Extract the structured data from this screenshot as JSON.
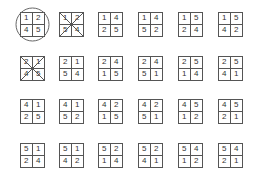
{
  "grid": {
    "columns_x": [
      20,
      59,
      98,
      138,
      178,
      218
    ],
    "rows_y": [
      12,
      56,
      99,
      143
    ],
    "permutations": [
      [
        [
          "1",
          "2",
          "4",
          "5"
        ],
        [
          "1",
          "2",
          "5",
          "4"
        ],
        [
          "1",
          "4",
          "2",
          "5"
        ],
        [
          "1",
          "4",
          "5",
          "2"
        ],
        [
          "1",
          "5",
          "2",
          "4"
        ],
        [
          "1",
          "5",
          "4",
          "2"
        ]
      ],
      [
        [
          "2",
          "1",
          "4",
          "5"
        ],
        [
          "2",
          "1",
          "5",
          "4"
        ],
        [
          "2",
          "4",
          "1",
          "5"
        ],
        [
          "2",
          "4",
          "5",
          "1"
        ],
        [
          "2",
          "5",
          "1",
          "4"
        ],
        [
          "2",
          "5",
          "4",
          "1"
        ]
      ],
      [
        [
          "4",
          "1",
          "2",
          "5"
        ],
        [
          "4",
          "1",
          "5",
          "2"
        ],
        [
          "4",
          "2",
          "1",
          "5"
        ],
        [
          "4",
          "2",
          "5",
          "1"
        ],
        [
          "4",
          "5",
          "1",
          "2"
        ],
        [
          "4",
          "5",
          "2",
          "1"
        ]
      ],
      [
        [
          "5",
          "1",
          "2",
          "4"
        ],
        [
          "5",
          "1",
          "4",
          "2"
        ],
        [
          "5",
          "2",
          "1",
          "4"
        ],
        [
          "5",
          "2",
          "4",
          "1"
        ],
        [
          "5",
          "4",
          "1",
          "2"
        ],
        [
          "5",
          "4",
          "2",
          "1"
        ]
      ]
    ],
    "circled": [
      [
        0,
        0
      ]
    ],
    "crossed": [
      [
        0,
        1
      ],
      [
        1,
        0
      ]
    ]
  },
  "colors": {
    "line": "#555555",
    "text": "#333333",
    "circle": "#666666"
  }
}
